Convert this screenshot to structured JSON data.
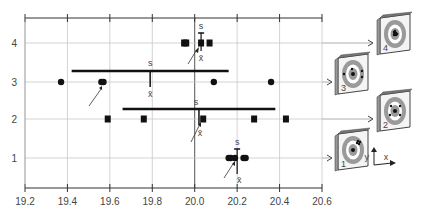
{
  "chart_data": {
    "type": "scatter",
    "title": "",
    "xlabel": "",
    "ylabel": "",
    "xlim": [
      19.2,
      20.6
    ],
    "ylim": [
      0.3,
      4.6
    ],
    "x_ticks": [
      "19.2",
      "19.4",
      "19.6",
      "19.8",
      "20.0",
      "20.2",
      "20.4",
      "20.6"
    ],
    "y_ticks": [
      "1",
      "2",
      "3",
      "4"
    ],
    "grid": true,
    "reference_line_x": 20.0,
    "rows": [
      {
        "row": 4,
        "marker": "square",
        "points": [
          19.95,
          19.96,
          20.03,
          20.07
        ],
        "mean": 20.03,
        "std_half_width": 0.0,
        "mean_label": "x̄",
        "std_label": "s",
        "target_label": "4"
      },
      {
        "row": 3,
        "marker": "circle",
        "points": [
          19.37,
          19.56,
          19.57,
          20.09,
          20.36
        ],
        "mean": 19.79,
        "std_half_width": 0.37,
        "mean_label": "x̄",
        "std_label": "s",
        "target_label": "3"
      },
      {
        "row": 2,
        "marker": "square",
        "points": [
          19.59,
          19.76,
          20.04,
          20.28,
          20.43
        ],
        "mean": 20.02,
        "std_half_width": 0.36,
        "mean_label": "x̄",
        "std_label": "s",
        "target_label": "2"
      },
      {
        "row": 1,
        "marker": "circle",
        "points": [
          20.16,
          20.17,
          20.19,
          20.23,
          20.24
        ],
        "mean": 20.2,
        "std_half_width": 0.02,
        "mean_label": "x̄",
        "std_label": "s",
        "target_label": "1"
      }
    ],
    "legend": {
      "axes_icon": {
        "x_label": "x",
        "y_label": "y"
      }
    },
    "annotations": [
      "s",
      "x̄"
    ]
  },
  "labels": {
    "s": "s",
    "xbar": "x̄",
    "axis_x": "x",
    "axis_y": "y",
    "targets": [
      "1",
      "2",
      "3",
      "4"
    ]
  }
}
